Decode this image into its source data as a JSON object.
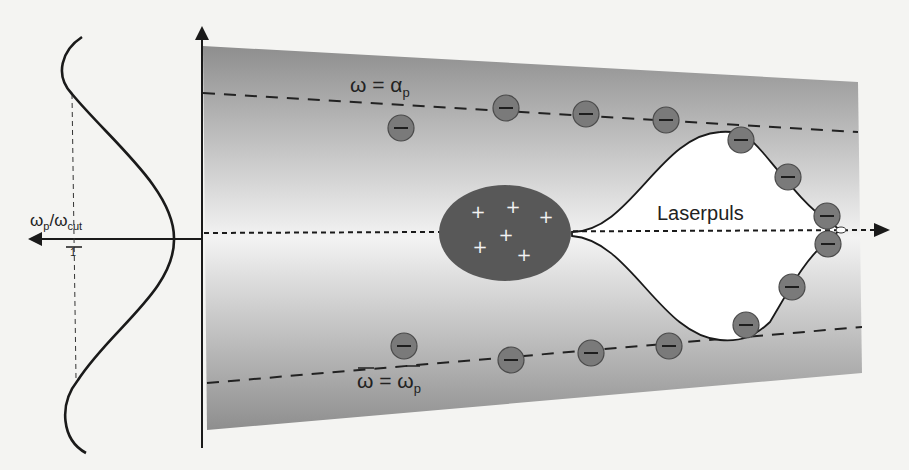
{
  "figure": {
    "type": "plasma wakefield / laser channel schematic",
    "colors": {
      "page_background": "#f4f4f2",
      "plasma_gradient_edge": "#8f8f8f",
      "plasma_gradient_center": "#f2f2f2",
      "ion_blob": "#555555",
      "electron": "#7a7a7a",
      "line": "#1a1a1a"
    },
    "labels": {
      "laser_pulse": "Laserpuls",
      "upper_boundary": "ω = α",
      "upper_boundary_sub": "p",
      "lower_boundary": "ω = ω",
      "lower_boundary_sub": "p",
      "profile_axis": "ω",
      "profile_axis_sub1": "p",
      "profile_axis_slash": "/ω",
      "profile_axis_sub2": "cut",
      "profile_tick": "1"
    },
    "ion_symbols": [
      "+",
      "+",
      "+",
      "+",
      "+",
      "+"
    ],
    "electron_symbol": "−",
    "electron_count": 16,
    "ion_count": 6
  }
}
